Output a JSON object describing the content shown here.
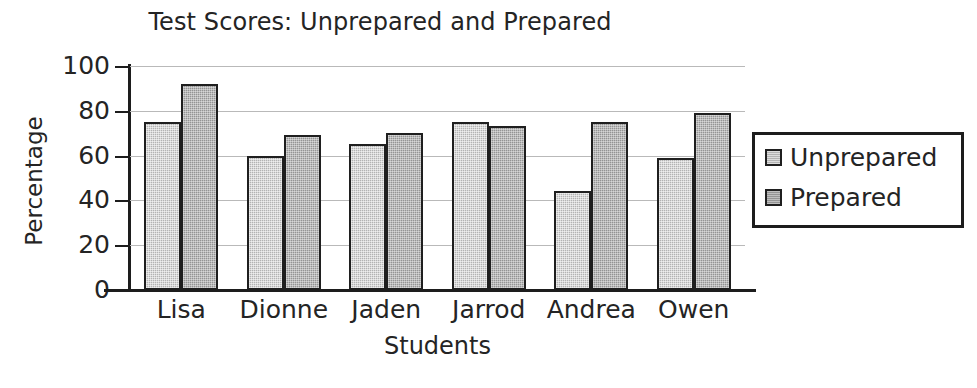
{
  "chart_data": {
    "type": "bar",
    "title": "Test Scores: Unprepared and Prepared",
    "xlabel": "Students",
    "ylabel": "Percentage",
    "categories": [
      "Lisa",
      "Dionne",
      "Jaden",
      "Jarrod",
      "Andrea",
      "Owen"
    ],
    "series": [
      {
        "name": "Unprepared",
        "color": "#b3b3b3",
        "values": [
          75,
          60,
          65,
          75,
          44,
          59
        ]
      },
      {
        "name": "Prepared",
        "color": "#949494",
        "values": [
          92,
          69,
          70,
          73,
          75,
          79
        ]
      }
    ],
    "ylim": [
      0,
      100
    ],
    "yticks": [
      0,
      20,
      40,
      60,
      80,
      100
    ],
    "ytick_labels": [
      "0",
      "20",
      "40",
      "60",
      "80",
      "100"
    ],
    "grid": true,
    "grid_axis": "y",
    "legend_position": "right",
    "legend_entries": [
      "Unprepared",
      "Prepared"
    ]
  },
  "legend": {
    "entries": [
      {
        "label": "Unprepared",
        "swatch": "legend-swatch-unprepared"
      },
      {
        "label": "Prepared",
        "swatch": "legend-swatch-prepared"
      }
    ]
  },
  "colors": {
    "unprepared": "#b3b3b3",
    "prepared": "#949494",
    "axis": "#1d1d1d",
    "gridline": "#b9b9b9",
    "text": "#242424",
    "background": "#ffffff"
  }
}
